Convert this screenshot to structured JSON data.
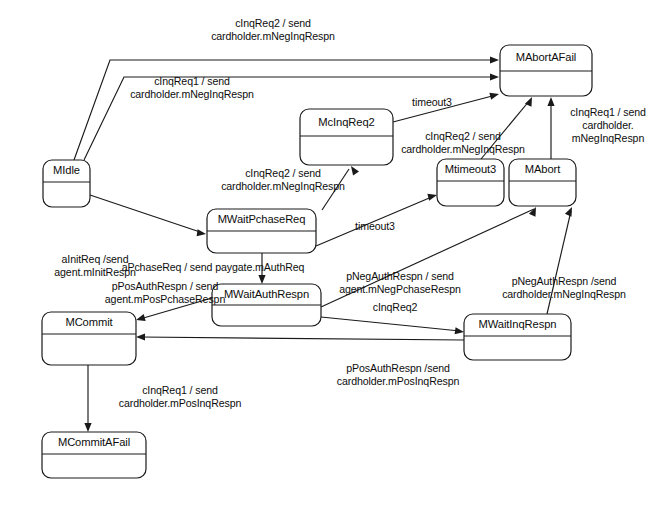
{
  "diagram": {
    "type": "uml-state-machine",
    "stroke_color": "#1a1a1a",
    "background_color": "#ffffff",
    "states": [
      {
        "id": "MIdle",
        "label": "MIdle",
        "x": 43,
        "y": 160,
        "w": 47,
        "h": 47,
        "header_h": 22
      },
      {
        "id": "McInqReq2",
        "label": "McInqReq2",
        "x": 300,
        "y": 109,
        "w": 93,
        "h": 56,
        "header_h": 27
      },
      {
        "id": "MAbortAFail",
        "label": "MAbortAFail",
        "x": 500,
        "y": 45,
        "w": 92,
        "h": 51,
        "header_h": 26
      },
      {
        "id": "MWaitPchaseReq",
        "label": "MWaitPchaseReq",
        "x": 207,
        "y": 209,
        "w": 109,
        "h": 44,
        "header_h": 22
      },
      {
        "id": "Mtimeout3",
        "label": "Mtimeout3",
        "x": 437,
        "y": 159,
        "w": 67,
        "h": 47,
        "header_h": 22
      },
      {
        "id": "MAbort",
        "label": "MAbort",
        "x": 509,
        "y": 159,
        "w": 67,
        "h": 47,
        "header_h": 22
      },
      {
        "id": "MWaitAuthRespn",
        "label": "MWaitAuthRespn",
        "x": 212,
        "y": 284,
        "w": 109,
        "h": 42,
        "header_h": 21
      },
      {
        "id": "MWaitInqRespn",
        "label": "MWaitInqRespn",
        "x": 464,
        "y": 314,
        "w": 107,
        "h": 46,
        "header_h": 22
      },
      {
        "id": "MCommit",
        "label": "MCommit",
        "x": 42,
        "y": 312,
        "w": 94,
        "h": 53,
        "header_h": 22
      },
      {
        "id": "MCommitAFail",
        "label": "MCommitAFail",
        "x": 42,
        "y": 432,
        "w": 104,
        "h": 46,
        "header_h": 22
      }
    ],
    "transitions": [
      {
        "id": "t1",
        "from": "MIdle",
        "to": "MAbortAFail",
        "label": [
          "cInqReq2 / send",
          "cardholder.mNegInqRespn"
        ],
        "label_x": 273,
        "label_y": 27,
        "path": "M 74,160 L 110,60 L 496,60",
        "arrow_at": [
          499,
          60
        ],
        "arrow_dir": "right"
      },
      {
        "id": "t2",
        "from": "MIdle",
        "to": "MAbortAFail",
        "label": [
          "cInqReq1 / send",
          "cardholder.mNegInqRespn"
        ],
        "label_x": 192,
        "label_y": 85,
        "path": "M 84,160 L 124,77 L 496,77",
        "arrow_at": [
          499,
          77
        ],
        "arrow_dir": "right"
      },
      {
        "id": "t3",
        "from": "McInqReq2",
        "to": "MAbortAFail",
        "label": [
          "timeout3"
        ],
        "label_x": 432,
        "label_y": 106,
        "path": "M 393,122 L 496,95",
        "arrow_at": [
          499,
          94
        ],
        "arrow_dir": "right-up"
      },
      {
        "id": "t4",
        "from": "MIdle",
        "to": "MWaitPchaseReq",
        "label": [
          "aInitReq /send",
          "agent.mInitRespn"
        ],
        "label_x": 95,
        "label_y": 263,
        "path": "M 90,195 L 203,233",
        "arrow_at": [
          206,
          234
        ],
        "arrow_dir": "right-down"
      },
      {
        "id": "t5",
        "from": "MWaitPchaseReq",
        "to": "McInqReq2",
        "label": [
          "cInqReq2 / send",
          "cardholder.mNegInqRespn"
        ],
        "label_x": 283,
        "label_y": 177,
        "path": "M 322,210 L 349,169",
        "arrow_at": [
          351,
          166
        ],
        "arrow_dir": "up-left"
      },
      {
        "id": "t6",
        "from": "MWaitPchaseReq",
        "to": "Mtimeout3",
        "label": [
          "timeout3"
        ],
        "label_x": 375,
        "label_y": 230,
        "path": "M 316,246 L 434,196",
        "arrow_at": [
          437,
          195
        ],
        "arrow_dir": "right-up"
      },
      {
        "id": "t7",
        "from": "Mtimeout3",
        "to": "MAbortAFail",
        "label": [
          "cInqReq2 / send",
          "cardholder.mNegInqRespn"
        ],
        "label_x": 463,
        "label_y": 140,
        "path": "M 481,159 L 530,100",
        "arrow_at": [
          532,
          97
        ],
        "arrow_dir": "up-right"
      },
      {
        "id": "t8",
        "from": "MAbort",
        "to": "MAbortAFail",
        "label": [
          "cInqReq1 / send",
          "cardholder.",
          "mNegInqRespn"
        ],
        "label_x": 608,
        "label_y": 116,
        "path": "M 551,159 L 551,100",
        "arrow_at": [
          551,
          97
        ],
        "arrow_dir": "up"
      },
      {
        "id": "t9",
        "from": "MWaitPchaseReq",
        "to": "MWaitAuthRespn",
        "label": [
          "aPchaseReq / send paygate.mAuthReq"
        ],
        "label_x": 213,
        "label_y": 271,
        "path": "M 262,253 L 262,281",
        "arrow_at": [
          262,
          284
        ],
        "arrow_dir": "down"
      },
      {
        "id": "t10",
        "from": "MWaitAuthRespn",
        "to": "MAbort",
        "label": [
          "pNegAuthRespn / send",
          "agent.mNegPchaseRespn"
        ],
        "label_x": 400,
        "label_y": 280,
        "path": "M 321,307 L 534,209",
        "arrow_at": [
          536,
          207
        ],
        "arrow_dir": "up-right"
      },
      {
        "id": "t11",
        "from": "MWaitAuthRespn",
        "to": "MCommit",
        "label": [
          "pPosAuthRespn / send",
          "agent.mPosPchaseRespn"
        ],
        "label_x": 165,
        "label_y": 290,
        "path": "M 212,298 L 140,319",
        "arrow_at": [
          136,
          320
        ],
        "arrow_dir": "left-down"
      },
      {
        "id": "t12",
        "from": "MWaitAuthRespn",
        "to": "MWaitInqRespn",
        "label": [
          "cInqReq2"
        ],
        "label_x": 395,
        "label_y": 311,
        "path": "M 321,317 L 460,331",
        "arrow_at": [
          464,
          332
        ],
        "arrow_dir": "right-down"
      },
      {
        "id": "t13",
        "from": "MWaitInqRespn",
        "to": "MAbort",
        "label": [
          "pNegAuthRespn /send",
          "cardholder.mNegInqRespn"
        ],
        "label_x": 564,
        "label_y": 285,
        "path": "M 547,314 L 571,211",
        "arrow_at": [
          572,
          207
        ],
        "arrow_dir": "up-right"
      },
      {
        "id": "t14",
        "from": "MWaitInqRespn",
        "to": "MCommit",
        "label": [
          "pPosAuthRespn /send",
          "cardholder.mPosInqRespn"
        ],
        "label_x": 398,
        "label_y": 372,
        "path": "M 464,340 L 140,337",
        "arrow_at": [
          136,
          337
        ],
        "arrow_dir": "left"
      },
      {
        "id": "t15",
        "from": "MCommit",
        "to": "MCommitAFail",
        "label": [
          "cInqReq1 / send",
          "cardholder.mPosInqRespn"
        ],
        "label_x": 180,
        "label_y": 394,
        "path": "M 88,365 L 88,428",
        "arrow_at": [
          88,
          432
        ],
        "arrow_dir": "down"
      }
    ]
  }
}
